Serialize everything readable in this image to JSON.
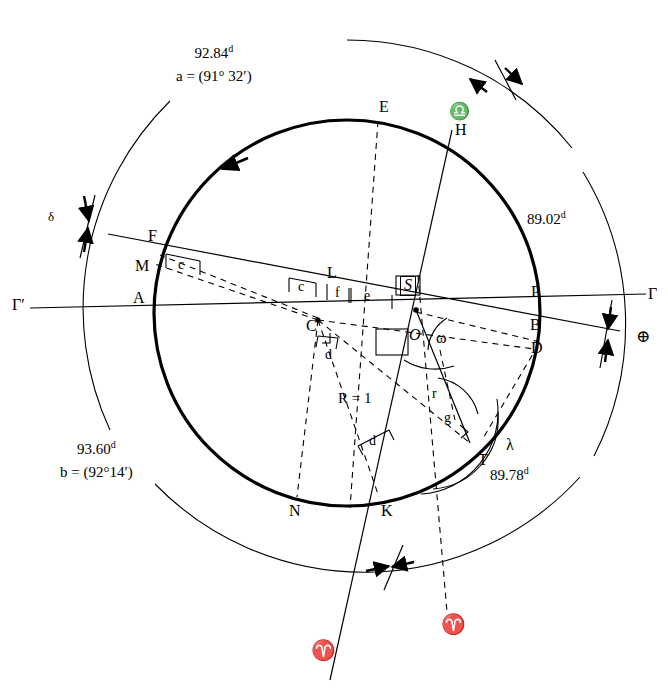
{
  "figure": {
    "radius_label": "R = 1"
  },
  "arc_annotations": [
    {
      "name": "arc-top-left",
      "value": "92.84",
      "unit": "d",
      "equation": "a = (91° 32′)",
      "x": 176,
      "y": 44
    },
    {
      "name": "arc-bottom-left",
      "value": "93.60",
      "unit": "d",
      "equation": "b = (92°14′)",
      "x": 60,
      "y": 440
    },
    {
      "name": "arc-top-right",
      "value": "89.02",
      "unit": "d",
      "equation": "",
      "x": 527,
      "y": 210
    },
    {
      "name": "arc-bottom-right",
      "value": "89.78",
      "unit": "d",
      "equation": "",
      "x": 490,
      "y": 466
    }
  ],
  "points": [
    {
      "name": "point-E",
      "label": "E",
      "x": 379,
      "y": 99,
      "style": "pt"
    },
    {
      "name": "point-H",
      "label": "H",
      "x": 455,
      "y": 122,
      "style": "pt"
    },
    {
      "name": "point-F",
      "label": "F",
      "x": 148,
      "y": 228,
      "style": "pt"
    },
    {
      "name": "point-M",
      "label": "M",
      "x": 135,
      "y": 258,
      "style": "pt"
    },
    {
      "name": "point-A",
      "label": "A",
      "x": 133,
      "y": 290,
      "style": "pt"
    },
    {
      "name": "point-L",
      "label": "L",
      "x": 327,
      "y": 265,
      "style": "pt"
    },
    {
      "name": "point-S",
      "label": "S",
      "x": 406,
      "y": 280,
      "style": "pt-i"
    },
    {
      "name": "point-P",
      "label": "P",
      "x": 531,
      "y": 284,
      "style": "pt"
    },
    {
      "name": "point-C",
      "label": "C",
      "x": 315,
      "y": 312,
      "style": "pt"
    },
    {
      "name": "point-O",
      "label": "O",
      "x": 413,
      "y": 324,
      "style": "pt-i"
    },
    {
      "name": "point-B",
      "label": "B",
      "x": 530,
      "y": 317,
      "style": "pt"
    },
    {
      "name": "point-D",
      "label": "D",
      "x": 531,
      "y": 340,
      "style": "pt"
    },
    {
      "name": "point-T",
      "label": "T",
      "x": 474,
      "y": 450,
      "style": "pt"
    },
    {
      "name": "point-N",
      "label": "N",
      "x": 289,
      "y": 503,
      "style": "pt"
    },
    {
      "name": "point-K",
      "label": "K",
      "x": 381,
      "y": 503,
      "style": "pt"
    }
  ],
  "segment_labels": [
    {
      "name": "segment-c-upper",
      "label": "c",
      "x": 184,
      "y": 262,
      "style": "seg"
    },
    {
      "name": "segment-c-lower",
      "label": "c",
      "x": 301,
      "y": 284,
      "style": "seg"
    },
    {
      "name": "segment-f",
      "label": "f",
      "x": 338,
      "y": 290,
      "style": "seg"
    },
    {
      "name": "segment-e",
      "label": "e",
      "x": 364,
      "y": 290,
      "style": "seg"
    },
    {
      "name": "segment-d-upper",
      "label": "d",
      "x": 330,
      "y": 345,
      "style": "seg"
    },
    {
      "name": "segment-d-lower",
      "label": "d",
      "x": 369,
      "y": 434,
      "style": "seg"
    },
    {
      "name": "segment-r",
      "label": "r",
      "x": 432,
      "y": 390,
      "style": "seg"
    },
    {
      "name": "segment-g",
      "label": "g",
      "x": 444,
      "y": 414,
      "style": "seg"
    },
    {
      "name": "radius-label",
      "label": "R = 1",
      "x": 338,
      "y": 391,
      "style": "rad"
    }
  ],
  "greek_labels": [
    {
      "name": "label-gamma-prime-left",
      "label": "Γ′",
      "x": 12,
      "y": 299,
      "style": "greek"
    },
    {
      "name": "label-gamma-right",
      "label": "Γ",
      "x": 648,
      "y": 289,
      "style": "greek"
    },
    {
      "name": "label-delta",
      "label": "δ",
      "x": 48,
      "y": 212,
      "style": "greek-sm"
    },
    {
      "name": "label-omega",
      "label": "ω",
      "x": 438,
      "y": 335,
      "style": "greek"
    },
    {
      "name": "label-lambda",
      "label": "λ",
      "x": 506,
      "y": 440,
      "style": "greek"
    }
  ],
  "symbols": [
    {
      "name": "libra-symbol",
      "label": "♎",
      "x": 449,
      "y": 108,
      "style": "zodiac"
    },
    {
      "name": "earth-symbol",
      "label": "⊕",
      "x": 638,
      "y": 331,
      "style": "zodiac"
    },
    {
      "name": "aries-symbol-left",
      "label": "♈",
      "x": 311,
      "y": 646,
      "style": "zodiac-big"
    },
    {
      "name": "aries-symbol-right",
      "label": "♈",
      "x": 441,
      "y": 620,
      "style": "zodiac-big"
    }
  ]
}
